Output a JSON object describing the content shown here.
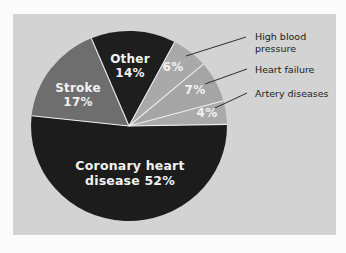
{
  "chart_data": {
    "type": "pie",
    "title": "",
    "slices": [
      {
        "label": "Coronary heart disease",
        "value": 52,
        "display": "Coronary heart disease 52%",
        "color": "#1c1c1c"
      },
      {
        "label": "Stroke",
        "value": 17,
        "display": "Stroke 17%",
        "color": "#6e6e6e"
      },
      {
        "label": "Other",
        "value": 14,
        "display": "Other 14%",
        "color": "#1e1e1e"
      },
      {
        "label": "High blood pressure",
        "value": 6,
        "display": "6%",
        "color": "#a9a9a9"
      },
      {
        "label": "Heart failure",
        "value": 7,
        "display": "7%",
        "color": "#a5a5a5"
      },
      {
        "label": "Artery diseases",
        "value": 4,
        "display": "4%",
        "color": "#aaaaaa"
      }
    ],
    "legend": {
      "position": "callouts-right"
    },
    "colors": {
      "panel": "#d3d3d3",
      "separator": "#eeeeee",
      "label_text": "#f2f2f2",
      "callout_text": "#1a1a1a"
    }
  },
  "labels": {
    "coronary_line1": "Coronary heart",
    "coronary_line2": "disease  52%",
    "stroke_line1": "Stroke",
    "stroke_line2": "17%",
    "other_line1": "Other",
    "other_line2": "14%",
    "hbp_pct": "6%",
    "hf_pct": "7%",
    "artery_pct": "4%"
  },
  "callouts": {
    "hbp_line1": "High blood",
    "hbp_line2": "pressure",
    "hf": "Heart failure",
    "artery": "Artery diseases"
  }
}
